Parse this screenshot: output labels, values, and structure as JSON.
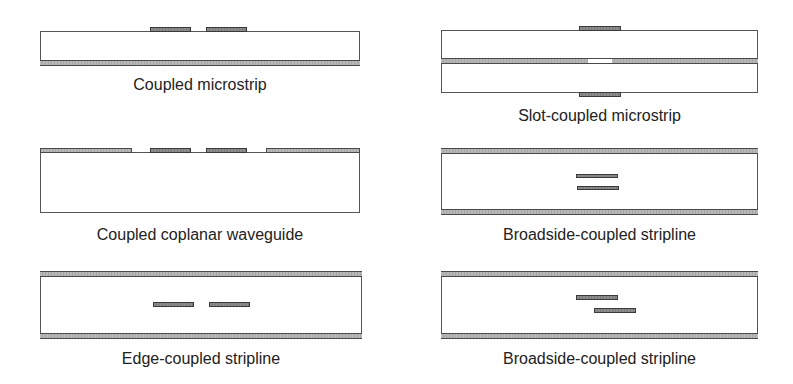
{
  "figure": {
    "panels": [
      {
        "id": "coupled-microstrip",
        "label": "Coupled microstrip"
      },
      {
        "id": "slot-coupled-microstrip",
        "label": "Slot-coupled microstrip"
      },
      {
        "id": "coupled-coplanar-waveguide",
        "label": "Coupled coplanar waveguide"
      },
      {
        "id": "broadside-coupled-stripline",
        "label": "Broadside-coupled stripline"
      },
      {
        "id": "edge-coupled-stripline",
        "label": "Edge-coupled stripline"
      },
      {
        "id": "offset-broadside-coupled-stripline",
        "label": "Broadside-coupled stripline"
      }
    ],
    "colors": {
      "outline": "#555555",
      "ground_plane": "#b0b0b0",
      "conductor": "#848484",
      "text": "#222222"
    }
  }
}
